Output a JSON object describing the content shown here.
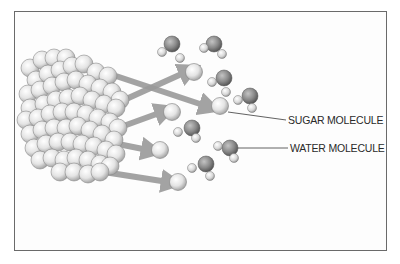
{
  "figure": {
    "labels": {
      "sugar_molecule": "SUGAR MOLECULE",
      "water_molecule": "WATER MOLECULE"
    },
    "colors": {
      "frame": "#6a6a6a",
      "arrow": "#9a9a9a",
      "sugar": "#e6e6e6",
      "water_oxygen": "#8a8a8a",
      "water_hydrogen": "#dcdcdc",
      "leader_line": "#3a3a3a",
      "label_text": "#2a2a2a"
    },
    "crystal": {
      "spheres": [
        [
          30,
          68
        ],
        [
          42,
          60
        ],
        [
          54,
          58
        ],
        [
          66,
          58
        ],
        [
          36,
          80
        ],
        [
          48,
          74
        ],
        [
          60,
          70
        ],
        [
          72,
          66
        ],
        [
          84,
          64
        ],
        [
          96,
          72
        ],
        [
          108,
          76
        ],
        [
          28,
          94
        ],
        [
          40,
          90
        ],
        [
          52,
          86
        ],
        [
          64,
          82
        ],
        [
          76,
          80
        ],
        [
          88,
          84
        ],
        [
          100,
          88
        ],
        [
          112,
          92
        ],
        [
          120,
          100
        ],
        [
          30,
          108
        ],
        [
          44,
          104
        ],
        [
          56,
          100
        ],
        [
          68,
          98
        ],
        [
          80,
          96
        ],
        [
          92,
          100
        ],
        [
          104,
          104
        ],
        [
          116,
          108
        ],
        [
          26,
          120
        ],
        [
          38,
          118
        ],
        [
          50,
          114
        ],
        [
          62,
          112
        ],
        [
          74,
          112
        ],
        [
          86,
          114
        ],
        [
          98,
          118
        ],
        [
          110,
          122
        ],
        [
          118,
          128
        ],
        [
          30,
          134
        ],
        [
          42,
          130
        ],
        [
          54,
          128
        ],
        [
          66,
          128
        ],
        [
          78,
          126
        ],
        [
          90,
          130
        ],
        [
          102,
          134
        ],
        [
          114,
          140
        ],
        [
          34,
          148
        ],
        [
          46,
          144
        ],
        [
          58,
          142
        ],
        [
          70,
          142
        ],
        [
          82,
          144
        ],
        [
          94,
          146
        ],
        [
          106,
          150
        ],
        [
          116,
          154
        ],
        [
          40,
          160
        ],
        [
          52,
          158
        ],
        [
          64,
          160
        ],
        [
          76,
          158
        ],
        [
          88,
          160
        ],
        [
          100,
          164
        ],
        [
          110,
          166
        ],
        [
          60,
          172
        ],
        [
          74,
          172
        ],
        [
          88,
          174
        ],
        [
          100,
          172
        ]
      ],
      "radius": 9
    },
    "arrows": [
      {
        "from": [
          116,
          76
        ],
        "to": [
          206,
          106
        ]
      },
      {
        "from": [
          124,
          100
        ],
        "to": [
          186,
          72
        ]
      },
      {
        "from": [
          118,
          128
        ],
        "to": [
          162,
          112
        ]
      },
      {
        "from": [
          118,
          144
        ],
        "to": [
          148,
          150
        ]
      },
      {
        "from": [
          104,
          172
        ],
        "to": [
          168,
          182
        ]
      }
    ],
    "sugar_molecules": [
      [
        194,
        72
      ],
      [
        220,
        106
      ],
      [
        172,
        112
      ],
      [
        160,
        150
      ],
      [
        178,
        182
      ]
    ],
    "water_molecules": [
      {
        "o": [
          172,
          44
        ],
        "h": [
          [
            162,
            52
          ],
          [
            180,
            58
          ]
        ]
      },
      {
        "o": [
          214,
          44
        ],
        "h": [
          [
            204,
            48
          ],
          [
            222,
            54
          ]
        ]
      },
      {
        "o": [
          224,
          78
        ],
        "h": [
          [
            212,
            82
          ],
          [
            226,
            92
          ]
        ]
      },
      {
        "o": [
          250,
          96
        ],
        "h": [
          [
            238,
            100
          ],
          [
            252,
            108
          ]
        ]
      },
      {
        "o": [
          192,
          128
        ],
        "h": [
          [
            178,
            132
          ],
          [
            196,
            138
          ]
        ]
      },
      {
        "o": [
          230,
          148
        ],
        "h": [
          [
            218,
            146
          ],
          [
            234,
            158
          ]
        ]
      },
      {
        "o": [
          206,
          164
        ],
        "h": [
          [
            192,
            168
          ],
          [
            210,
            176
          ]
        ]
      }
    ],
    "leaders": [
      {
        "from": [
          228,
          112
        ],
        "to": [
          286,
          120
        ],
        "label_key": "sugar_molecule"
      },
      {
        "from": [
          238,
          148
        ],
        "to": [
          288,
          148
        ],
        "label_key": "water_molecule"
      }
    ]
  }
}
